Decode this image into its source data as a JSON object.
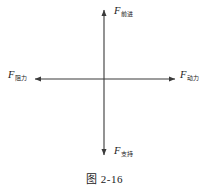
{
  "figure": {
    "caption": "图 2-16",
    "background_color": "#ffffff",
    "stroke_color": "#3a3a3a",
    "text_color": "#1a1a1a"
  },
  "diagram": {
    "type": "force-cross-diagram",
    "origin": {
      "x": 104,
      "y": 79
    },
    "axes": {
      "vertical": {
        "top_y": 8,
        "bottom_y": 157,
        "x": 104
      },
      "horizontal": {
        "left_x": 33,
        "right_x": 177,
        "y": 79
      }
    },
    "labels": {
      "up": {
        "symbol": "F",
        "subscript": "前进"
      },
      "down": {
        "symbol": "F",
        "subscript": "支持"
      },
      "left": {
        "symbol": "F",
        "subscript": "阻力"
      },
      "right": {
        "symbol": "F",
        "subscript": "动力"
      }
    }
  }
}
